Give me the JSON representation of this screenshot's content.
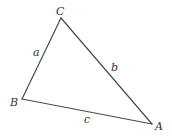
{
  "diagram": {
    "type": "triangle",
    "vertices": [
      {
        "id": "A",
        "label": "A",
        "x": 152,
        "y": 124,
        "label_x": 155,
        "label_y": 130
      },
      {
        "id": "B",
        "label": "B",
        "x": 22,
        "y": 99,
        "label_x": 10,
        "label_y": 106
      },
      {
        "id": "C",
        "label": "C",
        "x": 61,
        "y": 18,
        "label_x": 56,
        "label_y": 15
      }
    ],
    "sides": [
      {
        "id": "a",
        "label": "a",
        "from": "B",
        "to": "C",
        "label_x": 33,
        "label_y": 56
      },
      {
        "id": "b",
        "label": "b",
        "from": "C",
        "to": "A",
        "label_x": 111,
        "label_y": 71
      },
      {
        "id": "c",
        "label": "c",
        "from": "B",
        "to": "A",
        "label_x": 84,
        "label_y": 123
      }
    ],
    "colors": {
      "stroke": "#4a4a4a",
      "text": "#333333",
      "background": "#ffffff"
    }
  }
}
